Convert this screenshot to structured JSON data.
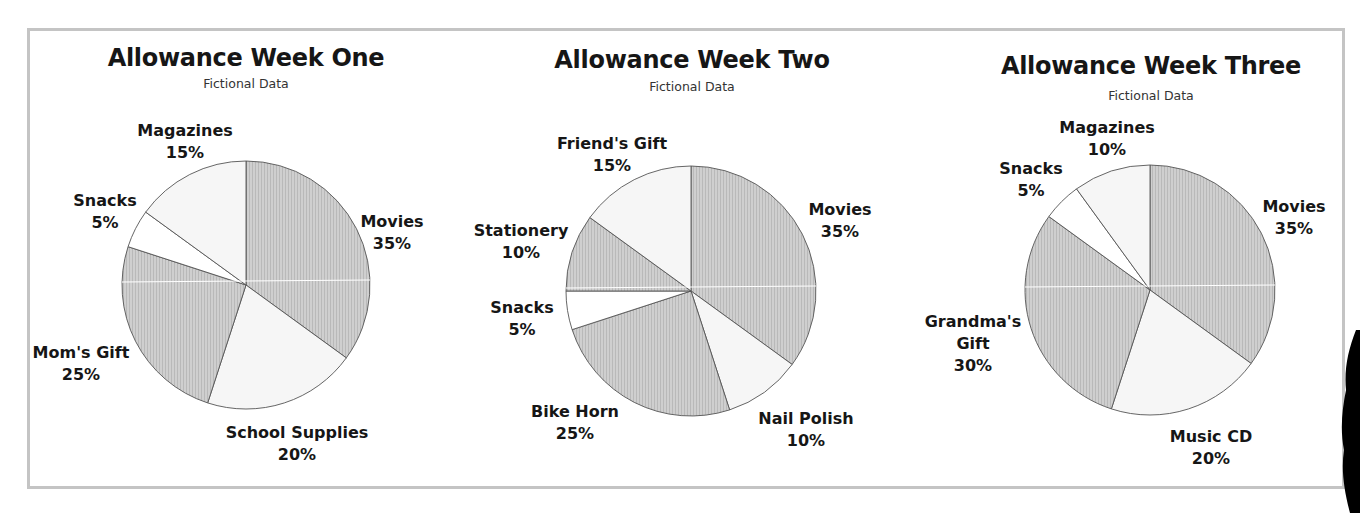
{
  "colors": {
    "shaded": "#cfcfcf",
    "hatch": "#b9b9b9",
    "light": "#f6f6f6",
    "white": "#ffffff",
    "edge": "#555555",
    "frame": "#c4c4c4"
  },
  "charts": [
    {
      "title": "Allowance Week One",
      "subtitle": "Fictional Data",
      "labels": [
        {
          "name": "Movies",
          "pct": "35%"
        },
        {
          "name": "School Supplies",
          "pct": "20%"
        },
        {
          "name": "Mom's Gift",
          "pct": "25%"
        },
        {
          "name": "Snacks",
          "pct": "5%"
        },
        {
          "name": "Magazines",
          "pct": "15%"
        }
      ]
    },
    {
      "title": "Allowance Week Two",
      "subtitle": "Fictional Data",
      "labels": [
        {
          "name": "Movies",
          "pct": "35%"
        },
        {
          "name": "Nail Polish",
          "pct": "10%"
        },
        {
          "name": "Bike Horn",
          "pct": "25%"
        },
        {
          "name": "Snacks",
          "pct": "5%"
        },
        {
          "name": "Stationery",
          "pct": "10%"
        },
        {
          "name": "Friend's Gift",
          "pct": "15%"
        }
      ]
    },
    {
      "title": "Allowance Week Three",
      "subtitle": "Fictional Data",
      "labels": [
        {
          "name": "Movies",
          "pct": "35%"
        },
        {
          "name": "Music CD",
          "pct": "20%"
        },
        {
          "name": "Grandma's",
          "name2": "Gift",
          "pct": "30%"
        },
        {
          "name": "Snacks",
          "pct": "5%"
        },
        {
          "name": "Magazines",
          "pct": "10%"
        }
      ]
    }
  ],
  "chart_data": [
    {
      "type": "pie",
      "title": "Allowance Week One",
      "subtitle": "Fictional Data",
      "categories": [
        "Movies",
        "School Supplies",
        "Mom's Gift",
        "Snacks",
        "Magazines"
      ],
      "values": [
        35,
        20,
        25,
        5,
        15
      ],
      "fills": [
        "shaded",
        "light",
        "shaded",
        "white",
        "light"
      ],
      "start_angle": "12 o'clock, clockwise",
      "unit": "%"
    },
    {
      "type": "pie",
      "title": "Allowance Week Two",
      "subtitle": "Fictional Data",
      "categories": [
        "Movies",
        "Nail Polish",
        "Bike Horn",
        "Snacks",
        "Stationery",
        "Friend's Gift"
      ],
      "values": [
        35,
        10,
        25,
        5,
        10,
        15
      ],
      "fills": [
        "shaded",
        "light",
        "shaded",
        "white",
        "shaded",
        "light"
      ],
      "start_angle": "12 o'clock, clockwise",
      "unit": "%"
    },
    {
      "type": "pie",
      "title": "Allowance Week Three",
      "subtitle": "Fictional Data",
      "categories": [
        "Movies",
        "Music CD",
        "Grandma's Gift",
        "Snacks",
        "Magazines"
      ],
      "values": [
        35,
        20,
        30,
        5,
        10
      ],
      "fills": [
        "shaded",
        "light",
        "shaded",
        "white",
        "light"
      ],
      "start_angle": "12 o'clock, clockwise",
      "unit": "%"
    }
  ]
}
